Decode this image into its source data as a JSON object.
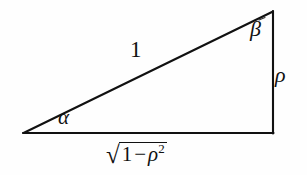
{
  "figure": {
    "kind": "right-triangle-diagram",
    "background_color": "#fefefe",
    "stroke_color": "#111111",
    "labels": {
      "hypotenuse": "1",
      "angle_left": "α",
      "angle_top_right": "β",
      "vertical_leg": "ρ",
      "base_radical_sign": "√",
      "base_radicand_first": "1",
      "base_radicand_operator": "−",
      "base_radicand_symbol": "ρ",
      "base_radicand_exponent": "2"
    },
    "geometry": {
      "left_vertex": [
        23,
        133
      ],
      "right_vertex": [
        273,
        133
      ],
      "apex": [
        273,
        11
      ],
      "stroke_width": 2
    }
  }
}
